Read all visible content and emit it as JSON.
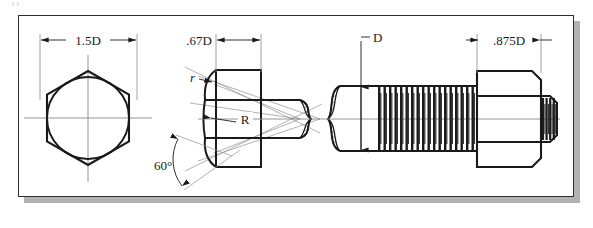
{
  "drawing": {
    "title_fragment": "ıı",
    "frame": {
      "x": 18,
      "y": 15,
      "w": 556,
      "h": 182,
      "border_color": "#2e2e2e",
      "shadow_color": "#b2b2b2"
    },
    "background": "#ffffff",
    "line_color": "#1a1a1a",
    "thin_line_color": "#7a7a7a"
  },
  "views": [
    {
      "name": "end-view-hex-head",
      "type": "hexagon-with-inscribed-circle",
      "center_x": 88,
      "center_y": 118,
      "across_corners_radius": 48
    },
    {
      "name": "side-view-hex-head",
      "type": "bolt-head-profile"
    },
    {
      "name": "threaded-shank",
      "type": "schematic-thread"
    },
    {
      "name": "hex-nut",
      "type": "nut-profile"
    }
  ],
  "dimensions": [
    {
      "id": "width-across-flats",
      "label": "1.5D",
      "applies_to": "end-view-hex-head",
      "x1": 40,
      "x2": 137,
      "y": 40
    },
    {
      "id": "head-thickness",
      "label": ".67D",
      "applies_to": "side-view-hex-head",
      "x1": 216,
      "x2": 261,
      "y": 40
    },
    {
      "id": "shank-diameter",
      "label": "D",
      "applies_to": "threaded-shank",
      "y1": 86,
      "y2": 151,
      "x": 361
    },
    {
      "id": "nut-thickness",
      "label": ".875D",
      "applies_to": "hex-nut",
      "x1": 477,
      "x2": 541,
      "y": 40
    }
  ],
  "annotations": [
    {
      "id": "chamfer-radius-small",
      "label": "r",
      "x": 196,
      "y": 79
    },
    {
      "id": "chamfer-radius-large",
      "label": "R",
      "x": 245,
      "y": 122
    },
    {
      "id": "chamfer-angle",
      "label": "60°",
      "x": 163,
      "y": 166
    }
  ],
  "thread": {
    "count": 18,
    "start_x": 378,
    "end_x": 477,
    "pitch": 5.5
  }
}
